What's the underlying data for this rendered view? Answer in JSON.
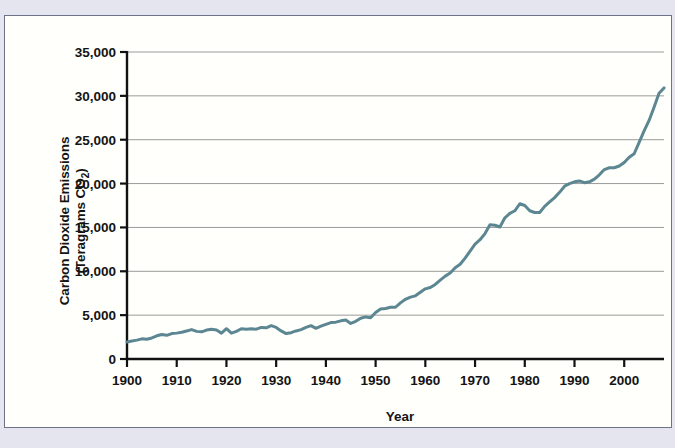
{
  "figure": {
    "panel_background": "#fffffb",
    "page_background": "#e4e5ef",
    "border_color": "#6e7288"
  },
  "chart_data": {
    "type": "line",
    "title": "",
    "xlabel": "Year",
    "ylabel": "Carbon Dioxide Emissions (Teragrams CO2)",
    "ylabel_line1": "Carbon Dioxide Emissions",
    "ylabel_line2_prefix": "(Teragrams CO",
    "ylabel_line2_sub": "2",
    "ylabel_line2_suffix": ")",
    "series_color": "#5c8792",
    "grid": true,
    "grid_color": "#9a9a9a",
    "legend": "none",
    "xlim": [
      1900,
      2008
    ],
    "ylim": [
      0,
      35000
    ],
    "xticks": [
      1900,
      1910,
      1920,
      1930,
      1940,
      1950,
      1960,
      1970,
      1980,
      1990,
      2000
    ],
    "xticklabels": [
      "1900",
      "1910",
      "1920",
      "1930",
      "1940",
      "1950",
      "1960",
      "1970",
      "1980",
      "1990",
      "2000"
    ],
    "yticks": [
      0,
      5000,
      10000,
      15000,
      20000,
      25000,
      30000,
      35000
    ],
    "yticklabels": [
      "0",
      "5,000",
      "10,000",
      "15,000",
      "20,000",
      "25,000",
      "30,000",
      "35,000"
    ],
    "x": [
      1900,
      1901,
      1902,
      1903,
      1904,
      1905,
      1906,
      1907,
      1908,
      1909,
      1910,
      1911,
      1912,
      1913,
      1914,
      1915,
      1916,
      1917,
      1918,
      1919,
      1920,
      1921,
      1922,
      1923,
      1924,
      1925,
      1926,
      1927,
      1928,
      1929,
      1930,
      1931,
      1932,
      1933,
      1934,
      1935,
      1936,
      1937,
      1938,
      1939,
      1940,
      1941,
      1942,
      1943,
      1944,
      1945,
      1946,
      1947,
      1948,
      1949,
      1950,
      1951,
      1952,
      1953,
      1954,
      1955,
      1956,
      1957,
      1958,
      1959,
      1960,
      1961,
      1962,
      1963,
      1964,
      1965,
      1966,
      1967,
      1968,
      1969,
      1970,
      1971,
      1972,
      1973,
      1974,
      1975,
      1976,
      1977,
      1978,
      1979,
      1980,
      1981,
      1982,
      1983,
      1984,
      1985,
      1986,
      1987,
      1988,
      1989,
      1990,
      1991,
      1992,
      1993,
      1994,
      1995,
      1996,
      1997,
      1998,
      1999,
      2000,
      2001,
      2002,
      2003,
      2004,
      2005,
      2006,
      2007,
      2008
    ],
    "values": [
      1950,
      2050,
      2150,
      2300,
      2250,
      2400,
      2650,
      2800,
      2700,
      2900,
      2950,
      3050,
      3200,
      3350,
      3150,
      3100,
      3300,
      3400,
      3300,
      2950,
      3450,
      2950,
      3150,
      3450,
      3400,
      3450,
      3400,
      3600,
      3550,
      3800,
      3600,
      3200,
      2900,
      3000,
      3200,
      3350,
      3600,
      3800,
      3500,
      3750,
      3950,
      4150,
      4200,
      4350,
      4450,
      4050,
      4300,
      4650,
      4800,
      4700,
      5300,
      5700,
      5750,
      5900,
      5900,
      6400,
      6800,
      7050,
      7200,
      7600,
      8000,
      8150,
      8500,
      9000,
      9450,
      9800,
      10400,
      10800,
      11500,
      12300,
      13100,
      13600,
      14300,
      15300,
      15250,
      15050,
      16100,
      16600,
      16900,
      17700,
      17500,
      16900,
      16700,
      16700,
      17400,
      17900,
      18400,
      19000,
      19700,
      20000,
      20200,
      20300,
      20100,
      20200,
      20500,
      21000,
      21600,
      21800,
      21800,
      22000,
      22400,
      23000,
      23400,
      24700,
      26000,
      27200,
      28700,
      30300,
      30900
    ],
    "annotations": []
  }
}
